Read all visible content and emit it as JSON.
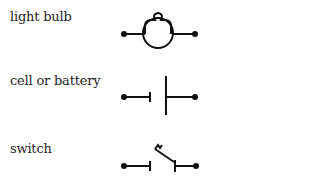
{
  "legend": {
    "items": [
      {
        "label": "light bulb",
        "symbol": "light-bulb-symbol"
      },
      {
        "label": "cell or battery",
        "symbol": "cell-battery-symbol"
      },
      {
        "label": "switch",
        "symbol": "switch-symbol"
      }
    ]
  },
  "colors": {
    "ink": "#111111",
    "background": "#ffffff"
  }
}
